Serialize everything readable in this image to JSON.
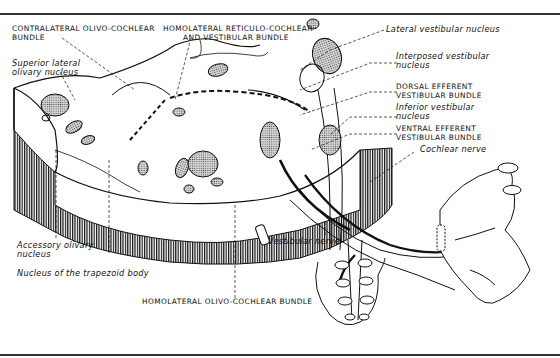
{
  "figure": {
    "type": "anatomical-diagram",
    "labels": {
      "contralateral_olivo_cochlear": [
        "CONTRALATERAL OLIVO-COCHLEAR",
        "BUNDLE"
      ],
      "homolateral_reticulo_cochlear": [
        "HOMOLATERAL RETICULO-COCHLEAR",
        "AND  VESTIBULAR BUNDLE"
      ],
      "lateral_vestibular": "Lateral vestibular nucleus",
      "interposed_vestibular": [
        "Interposed vestibular",
        "nucleus"
      ],
      "dorsal_efferent": [
        "DORSAL EFFERENT",
        "VESTIBULAR BUNDLE"
      ],
      "inferior_vestibular": [
        "Inferior vestibular",
        "nucleus"
      ],
      "ventral_efferent": [
        "VENTRAL EFFERENT",
        "VESTIBULAR BUNDLE"
      ],
      "cochlear_nerve": "Cochlear nerve",
      "superior_lateral_olivary": [
        "Superior lateral",
        "olivary nucleus"
      ],
      "accessory_olivary": [
        "Accessory olivary",
        "nucleus"
      ],
      "trapezoid_body": "Nucleus of the trapezoid body",
      "vestibular_nerve": "Vestibular nerve",
      "homolateral_olivo_cochlear": "HOMOLATERAL OLIVO-COCHLEAR BUNDLE"
    },
    "colors": {
      "ink": "#111111",
      "stipple": "#9a9a9a",
      "paper": "#ffffff"
    }
  }
}
